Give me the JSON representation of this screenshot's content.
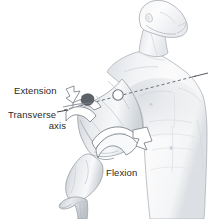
{
  "figure": {
    "background_color": "#ffffff",
    "labels": {
      "extension": "Extension",
      "transverse_line1": "Transverse",
      "transverse_line2": "axis",
      "flexion": "Flexion"
    },
    "label_color": "#2b2b2b",
    "anatomy": {
      "subject": "male-torso-head-and-right-arm",
      "skin_tone_light": "#fbfbfc",
      "skin_tone_mid": "#e4e6e9",
      "skin_tone_shadow": "#c4c8cd",
      "outline_color": "#8e939a",
      "joint_marker": {
        "name": "glenohumeral-joint-axis-point",
        "cx": 118,
        "cy": 95,
        "r": 5,
        "fill": "#ffffff",
        "stroke": "#6e747c"
      },
      "transverse_axis": {
        "name": "transverse-axis-dashed-line",
        "style": "dashed",
        "color": "#6b7178",
        "from_x": 62,
        "from_y": 109,
        "to_x": 206,
        "to_y": 72
      },
      "arrows": [
        {
          "name": "extension-arrow",
          "direction": "posterior-superior",
          "fill": "#ffffff",
          "stroke": "#7b8189"
        },
        {
          "name": "flexion-arrow",
          "direction": "anterior-superior",
          "fill": "#ffffff",
          "stroke": "#7b8189"
        }
      ]
    }
  }
}
